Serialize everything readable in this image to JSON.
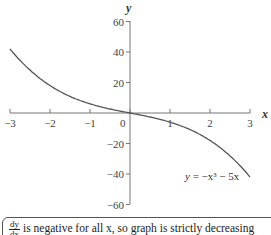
{
  "chart_data": {
    "type": "line",
    "title": "",
    "xlabel": "x",
    "ylabel": "y",
    "xlim": [
      -3,
      3
    ],
    "ylim": [
      -60,
      60
    ],
    "x_ticks": [
      "-3",
      "-2",
      "-1",
      "0",
      "1",
      "2",
      "3"
    ],
    "y_ticks": [
      "60",
      "40",
      "20",
      "-20",
      "-40",
      "-60"
    ],
    "grid": false,
    "series": [
      {
        "name": "y = -x³ - 5x",
        "x": [
          -3,
          -2.5,
          -2,
          -1.5,
          -1,
          -0.5,
          0,
          0.5,
          1,
          1.5,
          2,
          2.5,
          3
        ],
        "values": [
          42,
          28.1,
          18,
          10.9,
          6,
          2.6,
          0,
          -2.6,
          -6,
          -10.9,
          -18,
          -28.1,
          -42
        ]
      }
    ],
    "annotations": [
      "y = −x³ − 5x"
    ]
  },
  "labels": {
    "x_axis": "x",
    "y_axis": "y",
    "equation_y": "y",
    "equation_rest": " = −x³ − 5x",
    "zero": "0"
  },
  "note": {
    "frac_num": "dy",
    "frac_den": "dx",
    "text": "is negative for all x, so graph is strictly decreasing"
  }
}
